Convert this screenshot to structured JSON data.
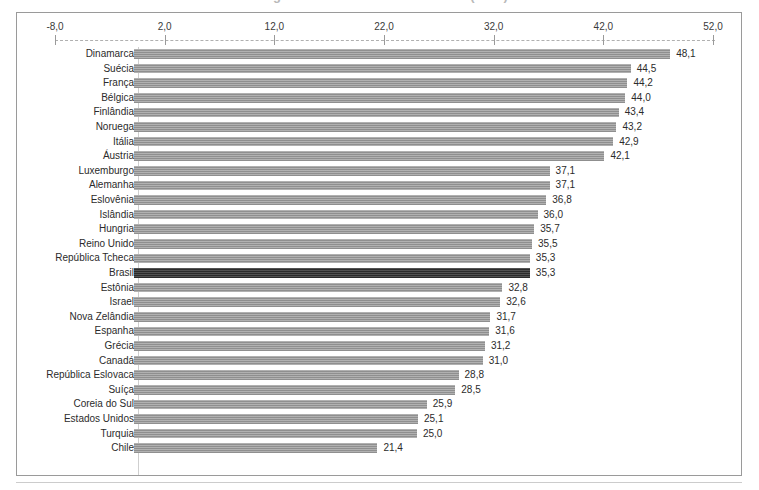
{
  "title_clipped": "Carga tributária bruta em % do PIB (2015)",
  "axis": {
    "ticks": [
      "-8,0",
      "2,0",
      "12,0",
      "22,0",
      "32,0",
      "42,0",
      "52,0"
    ],
    "tick_values": [
      -8,
      2,
      12,
      22,
      32,
      42,
      52
    ],
    "min": -8,
    "max": 52
  },
  "highlight_country": "Brasil",
  "colors": {
    "bar": "#8f8f8f",
    "bar_highlight": "#2c2c2c",
    "frame": "#9a9a9a",
    "text": "#2b2b2b"
  },
  "chart_data": {
    "type": "bar",
    "orientation": "horizontal",
    "title": "Carga tributária bruta em % do PIB (2015)",
    "xlabel": "",
    "ylabel": "",
    "xlim": [
      -8,
      52
    ],
    "grid": false,
    "legend": false,
    "categories": [
      "Dinamarca",
      "Suécia",
      "França",
      "Bélgica",
      "Finlândia",
      "Noruega",
      "Itália",
      "Áustria",
      "Luxemburgo",
      "Alemanha",
      "Eslovênia",
      "Islândia",
      "Hungria",
      "Reino Unido",
      "República Tcheca",
      "Brasil",
      "Estônia",
      "Israel",
      "Nova Zelândia",
      "Espanha",
      "Grécia",
      "Canadá",
      "República Eslovaca",
      "Suíça",
      "Coreia do Sul",
      "Estados Unidos",
      "Turquia",
      "Chile"
    ],
    "values": [
      48.1,
      44.5,
      44.2,
      44.0,
      43.4,
      43.2,
      42.9,
      42.1,
      37.1,
      37.1,
      36.8,
      36.0,
      35.7,
      35.5,
      35.3,
      35.3,
      32.8,
      32.6,
      31.7,
      31.6,
      31.2,
      31.0,
      28.8,
      28.5,
      25.9,
      25.1,
      25.0,
      21.4
    ],
    "value_labels": [
      "48,1",
      "44,5",
      "44,2",
      "44,0",
      "43,4",
      "43,2",
      "42,9",
      "42,1",
      "37,1",
      "37,1",
      "36,8",
      "36,0",
      "35,7",
      "35,5",
      "35,3",
      "35,3",
      "32,8",
      "32,6",
      "31,7",
      "31,6",
      "31,2",
      "31,0",
      "28,8",
      "28,5",
      "25,9",
      "25,1",
      "25,0",
      "21,4"
    ]
  }
}
